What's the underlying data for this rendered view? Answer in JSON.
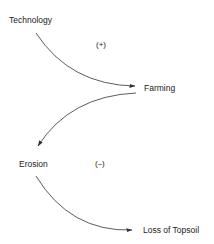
{
  "diagram": {
    "nodes": [
      {
        "id": "technology",
        "label": "Technology"
      },
      {
        "id": "farming",
        "label": "Farming"
      },
      {
        "id": "erosion",
        "label": "Erosion"
      },
      {
        "id": "loss_of_topsoil",
        "label": "Loss of Topsoil"
      }
    ],
    "edges": [
      {
        "from": "technology",
        "to": "farming"
      },
      {
        "from": "farming",
        "to": "erosion"
      },
      {
        "from": "erosion",
        "to": "loss_of_topsoil"
      }
    ],
    "signs": [
      {
        "label": "(+)",
        "near": "technology-farming"
      },
      {
        "label": "(–)",
        "near": "erosion-loss_of_topsoil"
      }
    ],
    "colors": {
      "line": "#333333",
      "text": "#222222",
      "background": "#ffffff"
    }
  }
}
